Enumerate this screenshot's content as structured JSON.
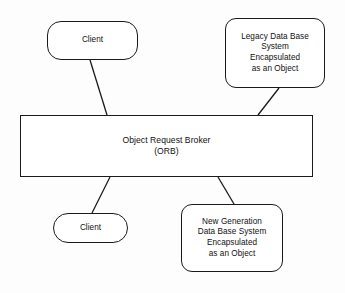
{
  "diagram": {
    "background_color": "#fdfdfd",
    "stroke_color": "#1a1a1a",
    "fill_color": "#ffffff",
    "nodes": [
      {
        "id": "client-top",
        "label": "Client",
        "shape": "rounded-rectangle"
      },
      {
        "id": "legacy-db",
        "label": "Legacy Data Base\nSystem\nEncapsulated\nas an Object",
        "shape": "rounded-rectangle"
      },
      {
        "id": "orb",
        "label": "Object Request Broker\n(ORB)",
        "shape": "rectangle"
      },
      {
        "id": "client-bottom",
        "label": "Client",
        "shape": "pill"
      },
      {
        "id": "newgen-db",
        "label": "New Generation\nData Base System\nEncapsulated\nas an Object",
        "shape": "rounded-rectangle"
      }
    ],
    "edges": [
      {
        "id": "client-top-to-orb",
        "from": "client-top",
        "to": "orb"
      },
      {
        "id": "legacy-db-to-orb",
        "from": "legacy-db",
        "to": "orb"
      },
      {
        "id": "orb-to-client-bottom",
        "from": "orb",
        "to": "client-bottom"
      },
      {
        "id": "orb-to-newgen-db",
        "from": "orb",
        "to": "newgen-db"
      }
    ]
  }
}
